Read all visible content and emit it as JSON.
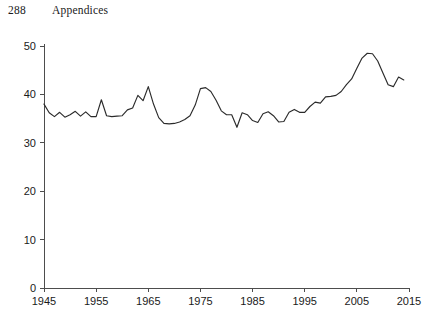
{
  "running_head": {
    "page_number": "288",
    "title": "Appendices"
  },
  "chart_data": {
    "type": "line",
    "title": "",
    "subtitle": "",
    "xlabel": "",
    "ylabel": "",
    "xlim": [
      1945,
      2015
    ],
    "ylim": [
      0,
      50
    ],
    "grid": false,
    "legend": false,
    "legend_position": "none",
    "line_color": "#2b2b2b",
    "axis_color": "#4d4d4d",
    "xticks": [
      1945,
      1955,
      1965,
      1975,
      1985,
      1995,
      2005,
      2015
    ],
    "xtick_labels": [
      "1945",
      "1955",
      "1965",
      "1975",
      "1985",
      "1995",
      "2005",
      "2015"
    ],
    "yticks": [
      0,
      10,
      20,
      30,
      40,
      50
    ],
    "ytick_labels": [
      "0",
      "10",
      "20",
      "30",
      "40",
      "50"
    ],
    "x": [
      1945,
      1946,
      1947,
      1948,
      1949,
      1950,
      1951,
      1952,
      1953,
      1954,
      1955,
      1956,
      1957,
      1958,
      1959,
      1960,
      1961,
      1962,
      1963,
      1964,
      1965,
      1966,
      1967,
      1968,
      1969,
      1970,
      1971,
      1972,
      1973,
      1974,
      1975,
      1976,
      1977,
      1978,
      1979,
      1980,
      1981,
      1982,
      1983,
      1984,
      1985,
      1986,
      1987,
      1988,
      1989,
      1990,
      1991,
      1992,
      1993,
      1994,
      1995,
      1996,
      1997,
      1998,
      1999,
      2000,
      2001,
      2002,
      2003,
      2004,
      2005,
      2006,
      2007,
      2008,
      2009,
      2010,
      2011,
      2012,
      2013,
      2014
    ],
    "values": [
      38.0,
      36.2,
      35.4,
      36.3,
      35.3,
      35.8,
      36.5,
      35.5,
      36.4,
      35.4,
      35.4,
      38.9,
      35.6,
      35.4,
      35.5,
      35.6,
      36.8,
      37.2,
      39.8,
      38.7,
      41.6,
      38.0,
      35.2,
      34.0,
      33.9,
      34.0,
      34.3,
      34.8,
      35.6,
      37.8,
      41.2,
      41.4,
      40.6,
      38.8,
      36.6,
      35.8,
      35.8,
      33.2,
      36.2,
      35.8,
      34.6,
      34.2,
      36.0,
      36.4,
      35.6,
      34.3,
      34.4,
      36.3,
      36.9,
      36.3,
      36.3,
      37.5,
      38.4,
      38.2,
      39.5,
      39.6,
      39.8,
      40.6,
      42.0,
      43.2,
      45.4,
      47.5,
      48.5,
      48.4,
      46.9,
      44.4,
      42.0,
      41.6,
      43.6,
      43.0
    ]
  }
}
